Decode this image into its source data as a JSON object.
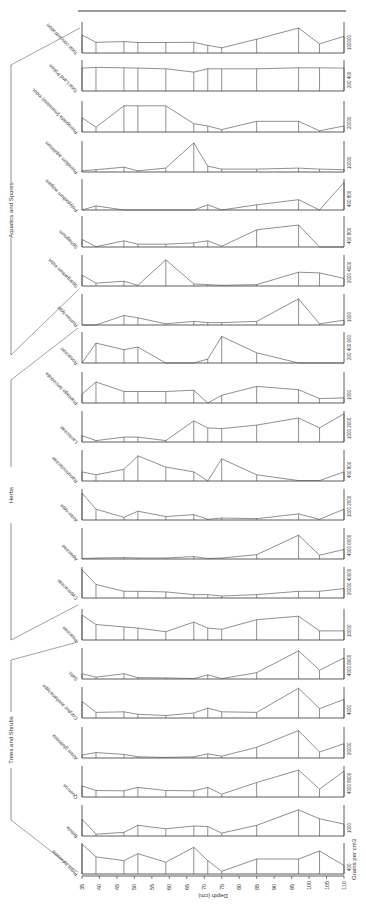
{
  "chart_data": {
    "type": "area",
    "title": "",
    "orientation": "rotated pollen diagram (depth runs left-to-right, taxa stacked vertically)",
    "xlabel": "Depth (cm)",
    "ylabel": "Grains per cm3",
    "x_ticks": [
      35,
      40,
      45,
      50,
      55,
      60,
      65,
      70,
      75,
      80,
      85,
      90,
      95,
      100,
      105,
      110
    ],
    "x": [
      35,
      39,
      47,
      51,
      59,
      67,
      71,
      75,
      85,
      97,
      103,
      110
    ],
    "groups": [
      {
        "name": "Aquatics and Spores",
        "members": [
          "Total concentration",
          "Total Land Pollen",
          "Pteropsida (monolete) indet.",
          "Pteridium aquilinum",
          "Polypodium vulgare",
          "Sphagnum",
          "Sparganium indet."
        ]
      },
      {
        "name": "Herbs",
        "members": [
          "Rumex-type",
          "Rosaceae",
          "Plantago lanceolata",
          "Lactuceae",
          "Ranunculaceae",
          "Aster-type",
          "Apiaceae",
          "Cyperaceae",
          "Poaceae"
        ]
      },
      {
        "name": "Trees and Shrubs",
        "members": [
          "Salix",
          "Corylus avellana-type",
          "Alnus glutinosa",
          "Quercus",
          "Betula",
          "Pinus sylvestris"
        ]
      }
    ],
    "series": [
      {
        "name": "Total concentration",
        "scale_label": "100000",
        "max": 130000,
        "values": [
          75000,
          45000,
          48000,
          44000,
          44000,
          45000,
          32000,
          22000,
          58000,
          105000,
          38000,
          70000
        ]
      },
      {
        "name": "Total Land Pollen",
        "scale_label": "200 400",
        "max": 460,
        "values": [
          340,
          350,
          345,
          340,
          330,
          280,
          330,
          330,
          330,
          345,
          345,
          340
        ]
      },
      {
        "name": "Pteropsida (monolete) indet.",
        "scale_label": "20000",
        "max": 26000,
        "values": [
          12000,
          4000,
          22000,
          22000,
          22000,
          7000,
          5000,
          2000,
          9000,
          9000,
          1000,
          5000
        ]
      },
      {
        "name": "Pteridium aquilinum",
        "scale_label": "10000",
        "max": 16000,
        "values": [
          600,
          1200,
          2500,
          600,
          2000,
          15000,
          3000,
          1500,
          1500,
          2000,
          1500,
          1200
        ]
      },
      {
        "name": "Polypodium vulgare",
        "scale_label": "400 800",
        "max": 900,
        "values": [
          0,
          120,
          0,
          0,
          0,
          0,
          150,
          0,
          150,
          300,
          0,
          800
        ]
      },
      {
        "name": "Sphagnum",
        "scale_label": "400 800",
        "max": 900,
        "values": [
          220,
          10,
          180,
          80,
          80,
          120,
          180,
          20,
          500,
          640,
          0,
          0
        ]
      },
      {
        "name": "Sparganium indet.",
        "scale_label": "2000 4000",
        "max": 4500,
        "values": [
          1600,
          400,
          700,
          100,
          3800,
          300,
          200,
          100,
          200,
          2000,
          1900,
          1100
        ]
      },
      {
        "name": "Rumex-type",
        "scale_label": "1000",
        "max": 1300,
        "values": [
          0,
          0,
          400,
          300,
          50,
          150,
          100,
          100,
          150,
          1100,
          50,
          200
        ]
      },
      {
        "name": "Rosaceae",
        "scale_label": "200 400 600",
        "max": 700,
        "values": [
          0,
          450,
          300,
          360,
          0,
          0,
          90,
          600,
          230,
          0,
          0,
          0
        ]
      },
      {
        "name": "Plantago lanceolata",
        "scale_label": "1000",
        "max": 1400,
        "values": [
          400,
          950,
          520,
          520,
          520,
          580,
          0,
          350,
          750,
          600,
          200,
          230
        ]
      },
      {
        "name": "Lactuceae",
        "scale_label": "1000 2000",
        "max": 2200,
        "values": [
          450,
          100,
          350,
          350,
          100,
          1500,
          1000,
          950,
          1200,
          1700,
          1000,
          2000
        ]
      },
      {
        "name": "Ranunculaceae",
        "scale_label": "400 800",
        "max": 850,
        "values": [
          250,
          170,
          320,
          690,
          380,
          250,
          0,
          610,
          170,
          10,
          10,
          250
        ]
      },
      {
        "name": "Aster-type",
        "scale_label": "1000 2000",
        "max": 2300,
        "values": [
          2000,
          800,
          200,
          650,
          250,
          400,
          50,
          150,
          100,
          450,
          50,
          800
        ]
      },
      {
        "name": "Apiaceae",
        "scale_label": "4000 6000",
        "max": 6500,
        "values": [
          100,
          200,
          300,
          200,
          200,
          500,
          100,
          200,
          900,
          5000,
          800,
          2000
        ]
      },
      {
        "name": "Cyperaceae",
        "scale_label": "20000 40000",
        "max": 46000,
        "values": [
          42000,
          20000,
          10000,
          10000,
          9000,
          5000,
          5000,
          3000,
          5000,
          10000,
          10000,
          14000
        ]
      },
      {
        "name": "Poaceae",
        "scale_label": "10000",
        "max": 13000,
        "values": [
          10500,
          6500,
          5500,
          5000,
          3500,
          7500,
          5000,
          4500,
          8500,
          10000,
          3800,
          3800
        ]
      },
      {
        "name": "Salix",
        "scale_label": "4000 8000",
        "max": 8800,
        "values": [
          1500,
          500,
          1500,
          400,
          300,
          100,
          1200,
          100,
          1800,
          8000,
          2500,
          6000
        ]
      },
      {
        "name": "Corylus avellana-type",
        "scale_label": "4000",
        "max": 5000,
        "values": [
          2700,
          900,
          1000,
          600,
          400,
          800,
          1600,
          1000,
          900,
          4800,
          1500,
          3000
        ]
      },
      {
        "name": "Alnus glutinosa",
        "scale_label": "20000",
        "max": 26000,
        "values": [
          2500,
          4500,
          3000,
          1000,
          500,
          1000,
          3500,
          1500,
          9000,
          23000,
          5000,
          12000
        ]
      },
      {
        "name": "Quercus",
        "scale_label": "4000 8000",
        "max": 9000,
        "values": [
          3200,
          1900,
          1800,
          2800,
          1900,
          1800,
          2800,
          800,
          4200,
          7800,
          2300,
          7500
        ]
      },
      {
        "name": "Betula",
        "scale_label": "1000",
        "max": 1300,
        "values": [
          700,
          80,
          150,
          450,
          300,
          420,
          400,
          120,
          450,
          1100,
          720,
          500
        ]
      },
      {
        "name": "Pinus sylvestris",
        "scale_label": "400",
        "max": 580,
        "values": [
          560,
          320,
          250,
          380,
          220,
          500,
          250,
          50,
          280,
          280,
          430,
          160
        ]
      }
    ]
  },
  "labels": {
    "xlabel": "Depth (cm)",
    "ylabel": "Grains per cm3",
    "group_aquatics": "Aquatics and Spores",
    "group_herbs": "Herbs",
    "group_trees": "Trees and Shrubs"
  }
}
